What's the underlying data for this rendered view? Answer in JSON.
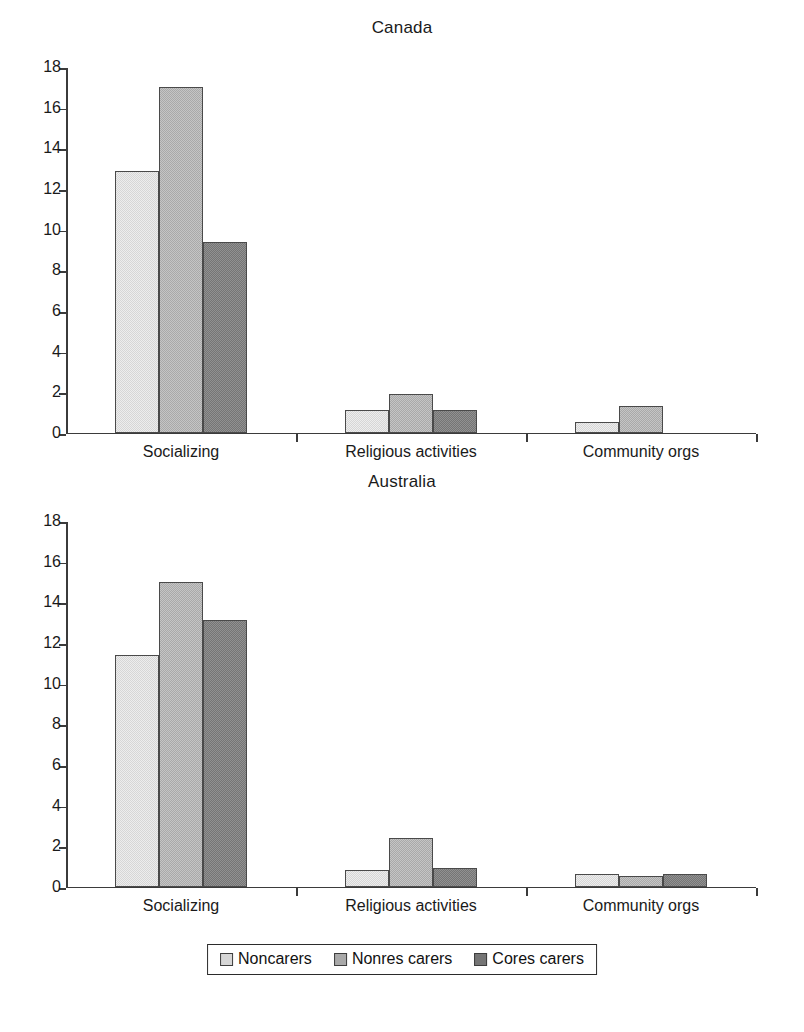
{
  "figure": {
    "panels": [
      "Canada",
      "Australia"
    ],
    "legend_position": "bottom-center"
  },
  "legend": {
    "items": [
      {
        "label": "Noncarers",
        "color": "#d6d6d6",
        "swatch_name": "legend-swatch-noncarers"
      },
      {
        "label": "Nonres carers",
        "color": "#a9a9a9",
        "swatch_name": "legend-swatch-nonres-carers"
      },
      {
        "label": "Cores carers",
        "color": "#757575",
        "swatch_name": "legend-swatch-cores-carers"
      }
    ]
  },
  "axis": {
    "yticks": [
      18,
      16,
      14,
      12,
      10,
      8,
      6,
      4,
      2,
      0
    ],
    "ymin": 0,
    "ymax": 18,
    "categories": [
      "Socializing",
      "Religious activities",
      "Community orgs"
    ]
  },
  "chart_data": [
    {
      "type": "bar",
      "title": "Canada",
      "xlabel": "",
      "ylabel": "",
      "ylim": [
        0,
        18
      ],
      "ytick_step": 2,
      "grid": false,
      "legend_position": "bottom-center",
      "categories": [
        "Socializing",
        "Religious activities",
        "Community orgs"
      ],
      "series": [
        {
          "name": "Noncarers",
          "color": "#d6d6d6",
          "values": [
            12.85,
            1.1,
            0.5
          ]
        },
        {
          "name": "Nonres carers",
          "color": "#a9a9a9",
          "values": [
            17.0,
            1.9,
            1.3
          ]
        },
        {
          "name": "Cores carers",
          "color": "#757575",
          "values": [
            9.35,
            1.1,
            0.0
          ]
        }
      ]
    },
    {
      "type": "bar",
      "title": "Australia",
      "xlabel": "",
      "ylabel": "",
      "ylim": [
        0,
        18
      ],
      "ytick_step": 2,
      "grid": false,
      "legend_position": "bottom-center",
      "categories": [
        "Socializing",
        "Religious activities",
        "Community orgs"
      ],
      "series": [
        {
          "name": "Noncarers",
          "color": "#d6d6d6",
          "values": [
            11.4,
            0.8,
            0.6
          ]
        },
        {
          "name": "Nonres carers",
          "color": "#a9a9a9",
          "values": [
            15.0,
            2.4,
            0.5
          ]
        },
        {
          "name": "Cores carers",
          "color": "#757575",
          "values": [
            13.1,
            0.9,
            0.6
          ]
        }
      ]
    }
  ]
}
